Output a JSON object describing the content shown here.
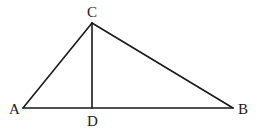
{
  "diagram": {
    "type": "geometry-triangle",
    "points": {
      "A": {
        "label": "A",
        "x": 23,
        "y": 108
      },
      "B": {
        "label": "B",
        "x": 233,
        "y": 108
      },
      "C": {
        "label": "C",
        "x": 92,
        "y": 23
      },
      "D": {
        "label": "D",
        "x": 92,
        "y": 108
      }
    },
    "segments": [
      "AB",
      "AC",
      "BC",
      "CD"
    ],
    "colors": {
      "line": "#1a1a1a",
      "background": "#ffffff"
    }
  }
}
